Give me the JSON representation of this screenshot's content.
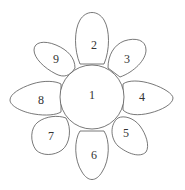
{
  "diagram": {
    "type": "flower",
    "center": {
      "label": "1",
      "cx": 92,
      "cy": 97,
      "r": 32
    },
    "petals": [
      {
        "id": "petal-2",
        "label": "2",
        "lx": 94,
        "ly": 45
      },
      {
        "id": "petal-3",
        "label": "3",
        "lx": 127,
        "ly": 59
      },
      {
        "id": "petal-4",
        "label": "4",
        "lx": 142,
        "ly": 97
      },
      {
        "id": "petal-5",
        "label": "5",
        "lx": 126,
        "ly": 133
      },
      {
        "id": "petal-6",
        "label": "6",
        "lx": 94,
        "ly": 155
      },
      {
        "id": "petal-7",
        "label": "7",
        "lx": 51,
        "ly": 136
      },
      {
        "id": "petal-8",
        "label": "8",
        "lx": 41,
        "ly": 100
      },
      {
        "id": "petal-9",
        "label": "9",
        "lx": 56,
        "ly": 59
      }
    ]
  }
}
